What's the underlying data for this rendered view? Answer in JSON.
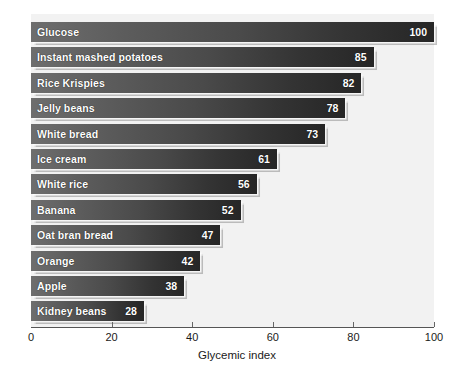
{
  "chart_data": {
    "type": "bar",
    "orientation": "horizontal",
    "title": "",
    "xlabel": "Glycemic index",
    "ylabel": "",
    "xlim": [
      0,
      100
    ],
    "xticks": [
      0,
      20,
      40,
      60,
      80,
      100
    ],
    "grid": false,
    "legend": null,
    "categories": [
      "Glucose",
      "Instant mashed potatoes",
      "Rice Krispies",
      "Jelly beans",
      "White bread",
      "Ice cream",
      "White rice",
      "Banana",
      "Oat bran bread",
      "Orange",
      "Apple",
      "Kidney beans"
    ],
    "values": [
      100,
      85,
      82,
      78,
      73,
      61,
      56,
      52,
      47,
      42,
      38,
      28
    ],
    "bars": [
      {
        "label": "Glucose",
        "value": 100,
        "value_text": "100"
      },
      {
        "label": "Instant mashed potatoes",
        "value": 85,
        "value_text": "85"
      },
      {
        "label": "Rice Krispies",
        "value": 82,
        "value_text": "82"
      },
      {
        "label": "Jelly beans",
        "value": 78,
        "value_text": "78"
      },
      {
        "label": "White bread",
        "value": 73,
        "value_text": "73"
      },
      {
        "label": "Ice cream",
        "value": 61,
        "value_text": "61"
      },
      {
        "label": "White rice",
        "value": 56,
        "value_text": "56"
      },
      {
        "label": "Banana",
        "value": 52,
        "value_text": "52"
      },
      {
        "label": "Oat bran bread",
        "value": 47,
        "value_text": "47"
      },
      {
        "label": "Orange",
        "value": 42,
        "value_text": "42"
      },
      {
        "label": "Apple",
        "value": 38,
        "value_text": "38"
      },
      {
        "label": "Kidney beans",
        "value": 28,
        "value_text": "28"
      }
    ],
    "xtick_labels": [
      "0",
      "20",
      "40",
      "60",
      "80",
      "100"
    ],
    "colors": {
      "bar_gradient_start": "#6e6e6e",
      "bar_gradient_end": "#262626",
      "plot_background": "#f2f2f2",
      "page_background": "#ffffff",
      "axis_line": "#555555",
      "label_text": "#ffffff",
      "tick_text": "#1a1a1a"
    }
  }
}
